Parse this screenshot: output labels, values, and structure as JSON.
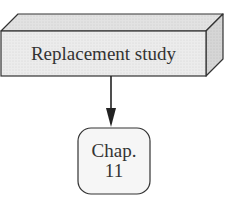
{
  "diagram": {
    "main_box": {
      "label": "Replacement study",
      "shape": "3d-box"
    },
    "connector": {
      "type": "arrow",
      "direction": "down"
    },
    "reference_box": {
      "line1": "Chap.",
      "line2": "11",
      "shape": "rounded-rectangle"
    }
  },
  "colors": {
    "stroke": "#333333",
    "front_face": "#eaeaea",
    "top_face": "#dcdcdc",
    "side_face": "#cfcfcf",
    "rounded_fill": "#f5f5f5",
    "text": "#333333"
  }
}
